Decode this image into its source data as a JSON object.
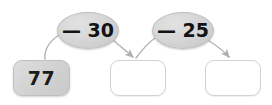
{
  "diagram": {
    "kind": "arrow-chain-subtraction",
    "colors": {
      "box_fill_filled": "#d3d3d3",
      "box_fill_empty": "#ffffff",
      "box_border": "#d2d2d2",
      "oval_fill": "#d4d4d4",
      "oval_border": "#bdbdbd",
      "arrow_stroke": "#b6b6b6",
      "text": "#131313",
      "background": "#ffffff"
    },
    "boxes": [
      {
        "id": "box-1",
        "value": "77",
        "filled": true,
        "name": "start-value-box"
      },
      {
        "id": "box-2",
        "value": "",
        "filled": false,
        "name": "answer-box-1"
      },
      {
        "id": "box-3",
        "value": "",
        "filled": false,
        "name": "answer-box-2"
      }
    ],
    "operations": [
      {
        "id": "oval-1",
        "label": "— 30",
        "operator": "—",
        "operand": "30",
        "name": "operation-minus-30"
      },
      {
        "id": "oval-2",
        "label": "— 25",
        "operator": "—",
        "operand": "25",
        "name": "operation-minus-25"
      }
    ],
    "arrows": [
      {
        "id": "arrow-1",
        "from": "box-1",
        "to": "oval-1",
        "arrowhead": false
      },
      {
        "id": "arrow-2",
        "from": "oval-1",
        "to": "box-2",
        "arrowhead": true
      },
      {
        "id": "arrow-3",
        "from": "box-2",
        "to": "oval-2",
        "arrowhead": false
      },
      {
        "id": "arrow-4",
        "from": "oval-2",
        "to": "box-3",
        "arrowhead": true
      }
    ]
  }
}
